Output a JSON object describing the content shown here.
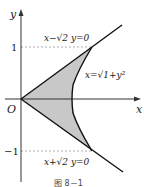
{
  "figure": {
    "caption": "图 8－1",
    "axes": {
      "x_label": "x",
      "y_label": "y",
      "origin_label": "O",
      "y_tick_pos": "1",
      "y_tick_neg": "−1"
    },
    "curves": {
      "upper_line": "x−√2 y=0",
      "lower_line": "x+√2 y=0",
      "hyperbola": "x=√1+y²"
    },
    "colors": {
      "shade": "#c8c8c8",
      "stroke": "#111111",
      "axis": "#333333",
      "dash": "#999999"
    }
  }
}
